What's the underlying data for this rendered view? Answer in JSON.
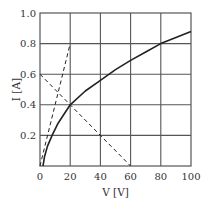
{
  "chart_data": {
    "type": "line",
    "title": "",
    "xlabel": "V [V]",
    "ylabel": "I [A]",
    "xlim": [
      0,
      100
    ],
    "ylim": [
      0,
      1.0
    ],
    "grid": true,
    "legend": "none",
    "x_ticks": [
      "0",
      "20",
      "40",
      "60",
      "80",
      "100"
    ],
    "y_ticks": [
      "0.2",
      "0.4",
      "0.6",
      "0.8",
      "1.0"
    ],
    "series": [
      {
        "name": "I-V characteristic curve",
        "style": "solid",
        "x": [
          2,
          3,
          5,
          8,
          12,
          20,
          30,
          40,
          50,
          60,
          70,
          80,
          90,
          100
        ],
        "y": [
          0.0,
          0.06,
          0.13,
          0.2,
          0.28,
          0.4,
          0.49,
          0.56,
          0.63,
          0.69,
          0.745,
          0.8,
          0.84,
          0.88
        ]
      },
      {
        "name": "dashed line through origin",
        "style": "dashed",
        "x": [
          0,
          20
        ],
        "y": [
          0.0,
          0.8
        ]
      },
      {
        "name": "dashed load line",
        "style": "dashed",
        "x": [
          0,
          60
        ],
        "y": [
          0.6,
          0.0
        ]
      }
    ],
    "annotations": [
      {
        "label": "intersection",
        "x": 20,
        "y": 0.4
      }
    ]
  }
}
